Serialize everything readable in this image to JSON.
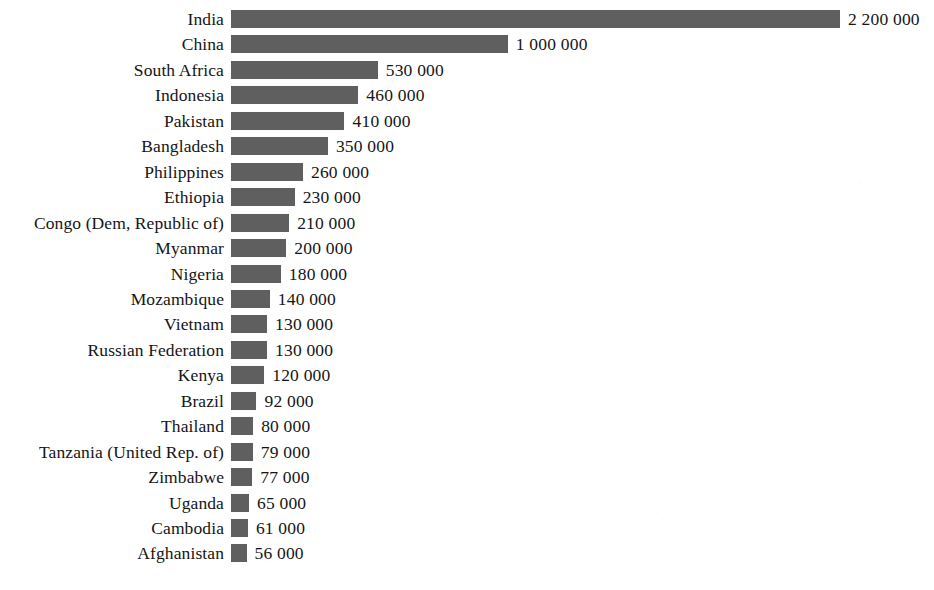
{
  "chart_data": {
    "type": "bar",
    "orientation": "horizontal",
    "title": "",
    "subtitle": "",
    "xlabel": "",
    "ylabel": "",
    "grid": false,
    "legend": null,
    "axis_visible": false,
    "tick_labels": [],
    "xlim": [
      0,
      2200000
    ],
    "value_label_format": "space-separated thousands",
    "bar_color": "#5f5f5f",
    "background_color": "#ffffff",
    "categories": [
      "India",
      "China",
      "South Africa",
      "Indonesia",
      "Pakistan",
      "Bangladesh",
      "Philippines",
      "Ethiopia",
      "Congo (Dem, Republic of)",
      "Myanmar",
      "Nigeria",
      "Mozambique",
      "Vietnam",
      "Russian Federation",
      "Kenya",
      "Brazil",
      "Thailand",
      "Tanzania (United Rep. of)",
      "Zimbabwe",
      "Uganda",
      "Cambodia",
      "Afghanistan"
    ],
    "values": [
      2200000,
      1000000,
      530000,
      460000,
      410000,
      350000,
      260000,
      230000,
      210000,
      200000,
      180000,
      140000,
      130000,
      130000,
      120000,
      92000,
      80000,
      79000,
      77000,
      65000,
      61000,
      56000
    ],
    "value_labels": [
      "2 200 000",
      "1 000 000",
      "530 000",
      "460 000",
      "410 000",
      "350 000",
      "260 000",
      "230 000",
      "210 000",
      "200 000",
      "180 000",
      "140 000",
      "130 000",
      "130 000",
      "120 000",
      "92 000",
      "80 000",
      "79 000",
      "77 000",
      "65 000",
      "61 000",
      "56 000"
    ]
  }
}
